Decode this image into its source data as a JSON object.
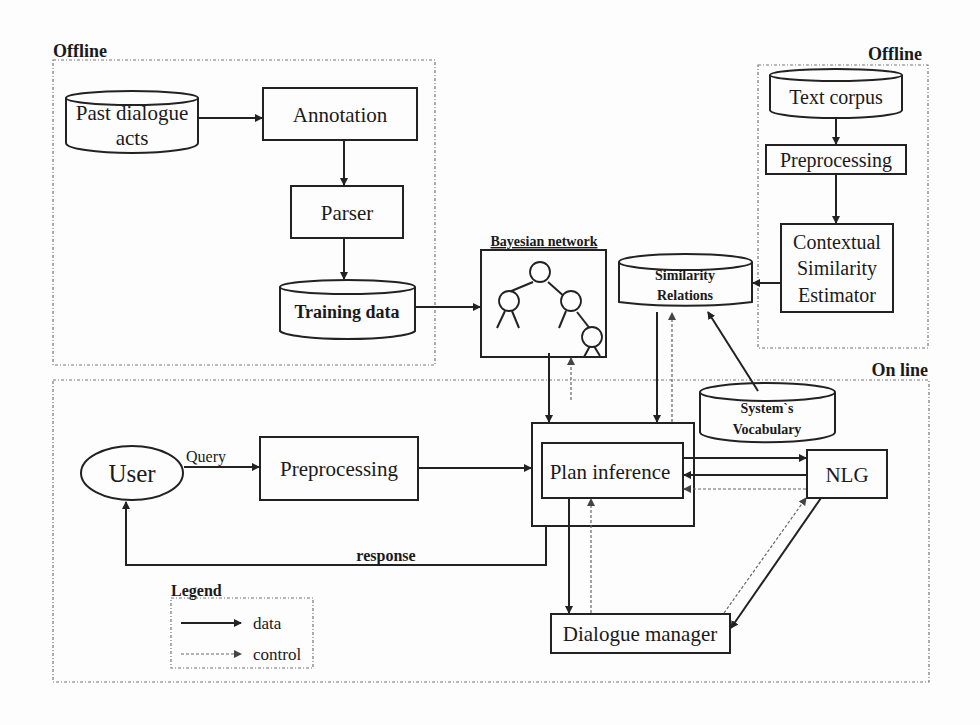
{
  "diagram": {
    "groups": {
      "offline_left": "Offline",
      "offline_right": "Offline",
      "online": "On line",
      "legend": "Legend"
    },
    "nodes": {
      "past_dialogue_acts": [
        "Past dialogue",
        "acts"
      ],
      "annotation": "Annotation",
      "parser": "Parser",
      "training_data": "Training data",
      "bayesian_network": "Bayesian network",
      "text_corpus": "Text corpus",
      "preprocessing_offline": "Preprocessing",
      "contextual_similarity_estimator": [
        "Contextual",
        "Similarity",
        "Estimator"
      ],
      "similarity_relations": [
        "Similarity",
        "Relations"
      ],
      "systems_vocabulary": [
        "System`s",
        "Vocabulary"
      ],
      "user": "User",
      "preprocessing_online": "Preprocessing",
      "plan_inference": "Plan inference",
      "nlg": "NLG",
      "dialogue_manager": "Dialogue manager"
    },
    "edge_labels": {
      "query": "Query",
      "response": "response"
    },
    "legend_items": [
      {
        "style": "solid",
        "label": "data"
      },
      {
        "style": "dotted",
        "label": "control"
      }
    ]
  }
}
